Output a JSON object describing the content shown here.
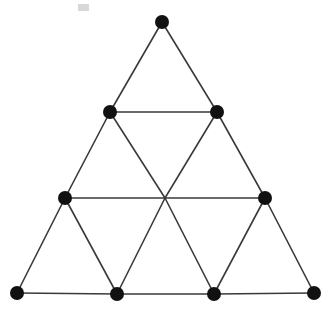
{
  "figure": {
    "type": "point-and-line diagram",
    "width": 335,
    "height": 316,
    "background_color": "#ffffff",
    "edge_color": "#3a3a3a",
    "edge_width": 1.6,
    "node_color": "#111111",
    "node_radius": 7
  },
  "chart_data": {
    "type": "scatter",
    "xlabel": "",
    "ylabel": "",
    "xlim": [
      0,
      335
    ],
    "ylim": [
      0,
      316
    ],
    "grid": false,
    "legend": "none",
    "nodes": [
      {
        "id": "n0",
        "label": "apex",
        "row": 0,
        "col": 0,
        "x": 162,
        "y": 22,
        "filled": true,
        "radius": 7
      },
      {
        "id": "n1",
        "label": "row2-left",
        "row": 1,
        "col": 0,
        "x": 110,
        "y": 112,
        "filled": true,
        "radius": 7
      },
      {
        "id": "n2",
        "label": "row2-right",
        "row": 1,
        "col": 1,
        "x": 217,
        "y": 112,
        "filled": true,
        "radius": 7
      },
      {
        "id": "n3",
        "label": "row3-left",
        "row": 2,
        "col": 0,
        "x": 65,
        "y": 198,
        "filled": true,
        "radius": 7
      },
      {
        "id": "n4",
        "label": "row3-center",
        "row": 2,
        "col": 1,
        "x": 165,
        "y": 198,
        "filled": false,
        "radius": 0
      },
      {
        "id": "n5",
        "label": "row3-right",
        "row": 2,
        "col": 2,
        "x": 265,
        "y": 198,
        "filled": true,
        "radius": 7
      },
      {
        "id": "n6",
        "label": "row4-left",
        "row": 3,
        "col": 0,
        "x": 17,
        "y": 293,
        "filled": true,
        "radius": 7
      },
      {
        "id": "n7",
        "label": "row4-midleft",
        "row": 3,
        "col": 1,
        "x": 117,
        "y": 294,
        "filled": true,
        "radius": 7
      },
      {
        "id": "n8",
        "label": "row4-midright",
        "row": 3,
        "col": 2,
        "x": 214,
        "y": 294,
        "filled": true,
        "radius": 7
      },
      {
        "id": "n9",
        "label": "row4-right",
        "row": 3,
        "col": 3,
        "x": 314,
        "y": 293,
        "filled": true,
        "radius": 7
      }
    ],
    "edges": [
      {
        "id": "e0",
        "from": "n0",
        "to": "n1"
      },
      {
        "id": "e1",
        "from": "n0",
        "to": "n2"
      },
      {
        "id": "e2",
        "from": "n1",
        "to": "n2"
      },
      {
        "id": "e3",
        "from": "n1",
        "to": "n3"
      },
      {
        "id": "e4",
        "from": "n1",
        "to": "n4"
      },
      {
        "id": "e5",
        "from": "n2",
        "to": "n4"
      },
      {
        "id": "e6",
        "from": "n2",
        "to": "n5"
      },
      {
        "id": "e7",
        "from": "n3",
        "to": "n4"
      },
      {
        "id": "e8",
        "from": "n4",
        "to": "n5"
      },
      {
        "id": "e9",
        "from": "n3",
        "to": "n6"
      },
      {
        "id": "e10",
        "from": "n3",
        "to": "n7"
      },
      {
        "id": "e11",
        "from": "n4",
        "to": "n7"
      },
      {
        "id": "e12",
        "from": "n4",
        "to": "n8"
      },
      {
        "id": "e13",
        "from": "n5",
        "to": "n8"
      },
      {
        "id": "e14",
        "from": "n5",
        "to": "n9"
      },
      {
        "id": "e15",
        "from": "n6",
        "to": "n7"
      },
      {
        "id": "e16",
        "from": "n7",
        "to": "n8"
      },
      {
        "id": "e17",
        "from": "n8",
        "to": "n9"
      }
    ],
    "counts": {
      "node_positions": 10,
      "filled_nodes": 9,
      "unfilled_nodes": 1,
      "edges": 18,
      "small_triangles": 9
    },
    "artifacts": [
      {
        "id": "a0",
        "label": "scan-smudge",
        "x": 78,
        "y": 4,
        "width": 11,
        "height": 7
      }
    ]
  }
}
